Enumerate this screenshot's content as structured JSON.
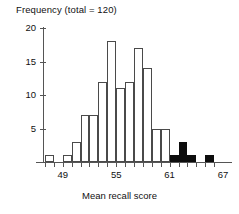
{
  "chart_data": {
    "type": "bar",
    "title": "Frequency (total = 120)",
    "xlabel": "Mean recall score",
    "ylabel": "Frequency (total = 120)",
    "xlim": [
      46,
      68
    ],
    "ylim": [
      0,
      20
    ],
    "grid": false,
    "legend": "none",
    "bin_width": 1,
    "xticks": [
      49,
      55,
      61,
      67
    ],
    "xtick_labels": [
      "49",
      "55",
      "61",
      "67"
    ],
    "yticks": [
      5,
      10,
      15,
      20
    ],
    "ytick_labels": [
      "5",
      "10",
      "15",
      "20"
    ],
    "total": 120,
    "bar_styles": {
      "open": "white fill with thin dark outline",
      "filled": "solid black fill"
    },
    "colors": {
      "axis": "#555555",
      "bar_outline": "#4a4a4a",
      "bar_open_fill": "#ffffff",
      "bar_filled": "#0d0d0d",
      "text": "#111111",
      "background": "#ffffff"
    },
    "bins": [
      {
        "x0": 47,
        "x1": 48,
        "value": 1,
        "style": "open"
      },
      {
        "x0": 49,
        "x1": 50,
        "value": 1,
        "style": "open"
      },
      {
        "x0": 50,
        "x1": 51,
        "value": 3,
        "style": "open"
      },
      {
        "x0": 51,
        "x1": 52,
        "value": 7,
        "style": "open"
      },
      {
        "x0": 52,
        "x1": 53,
        "value": 7,
        "style": "open"
      },
      {
        "x0": 53,
        "x1": 54,
        "value": 12,
        "style": "open"
      },
      {
        "x0": 54,
        "x1": 55,
        "value": 18,
        "style": "open"
      },
      {
        "x0": 55,
        "x1": 56,
        "value": 11,
        "style": "open"
      },
      {
        "x0": 56,
        "x1": 57,
        "value": 12,
        "style": "open"
      },
      {
        "x0": 57,
        "x1": 58,
        "value": 17,
        "style": "open"
      },
      {
        "x0": 58,
        "x1": 59,
        "value": 14,
        "style": "open"
      },
      {
        "x0": 59,
        "x1": 60,
        "value": 5,
        "style": "open"
      },
      {
        "x0": 60,
        "x1": 61,
        "value": 5,
        "style": "open"
      },
      {
        "x0": 61,
        "x1": 62,
        "value": 1,
        "style": "filled"
      },
      {
        "x0": 62,
        "x1": 63,
        "value": 3,
        "style": "filled"
      },
      {
        "x0": 63,
        "x1": 64,
        "value": 1,
        "style": "filled"
      },
      {
        "x0": 65,
        "x1": 66,
        "value": 1,
        "style": "filled"
      }
    ]
  }
}
